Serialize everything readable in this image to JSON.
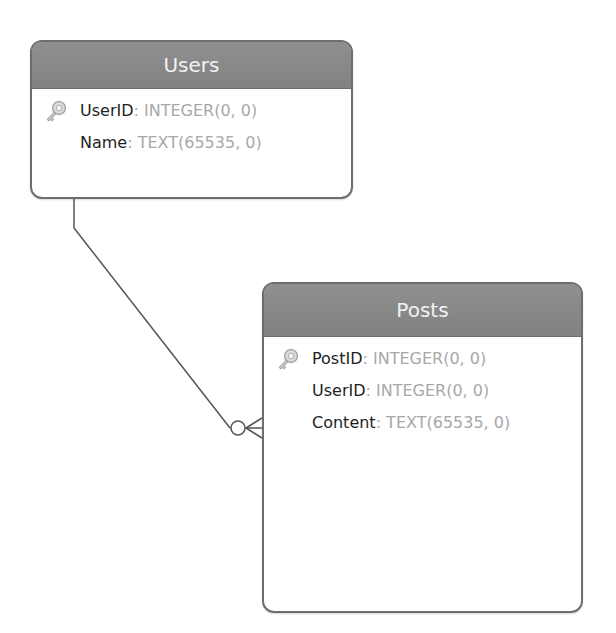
{
  "diagram": {
    "type": "entity-relationship",
    "entities": [
      {
        "name": "Users",
        "fields": [
          {
            "name": "UserID",
            "type": ": INTEGER(0, 0)",
            "primary_key": true,
            "icon": "key-icon"
          },
          {
            "name": "Name",
            "type": ": TEXT(65535, 0)",
            "primary_key": false
          }
        ]
      },
      {
        "name": "Posts",
        "fields": [
          {
            "name": "PostID",
            "type": ": INTEGER(0, 0)",
            "primary_key": true,
            "icon": "key-icon"
          },
          {
            "name": "UserID",
            "type": ": INTEGER(0, 0)",
            "primary_key": false
          },
          {
            "name": "Content",
            "type": ": TEXT(65535, 0)",
            "primary_key": false
          }
        ]
      }
    ],
    "relationships": [
      {
        "from": "Users",
        "to": "Posts",
        "from_cardinality": "one",
        "to_cardinality": "zero-or-many",
        "notation": "crow's foot"
      }
    ],
    "colors": {
      "header_bg": "#8a8a8a",
      "header_text": "#f2f2f2",
      "border": "#6e6e6e",
      "field_name": "#1e1e1e",
      "field_type": "#a8a8a8",
      "connector": "#555555"
    }
  }
}
